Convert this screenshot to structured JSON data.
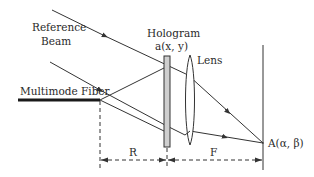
{
  "diagram": {
    "labels": {
      "reference_beam_line1": "Reference",
      "reference_beam_line2": "Beam",
      "hologram_line1": "Hologram",
      "hologram_line2": "a(x, y)",
      "lens": "Lens",
      "multimode_fiber": "Multimode Fiber",
      "distance_r": "R",
      "distance_f": "F",
      "point_a": "A(α, β)"
    },
    "colors": {
      "stroke": "#333333",
      "hologram_fill": "#cfcfcf",
      "background": "#ffffff"
    }
  }
}
